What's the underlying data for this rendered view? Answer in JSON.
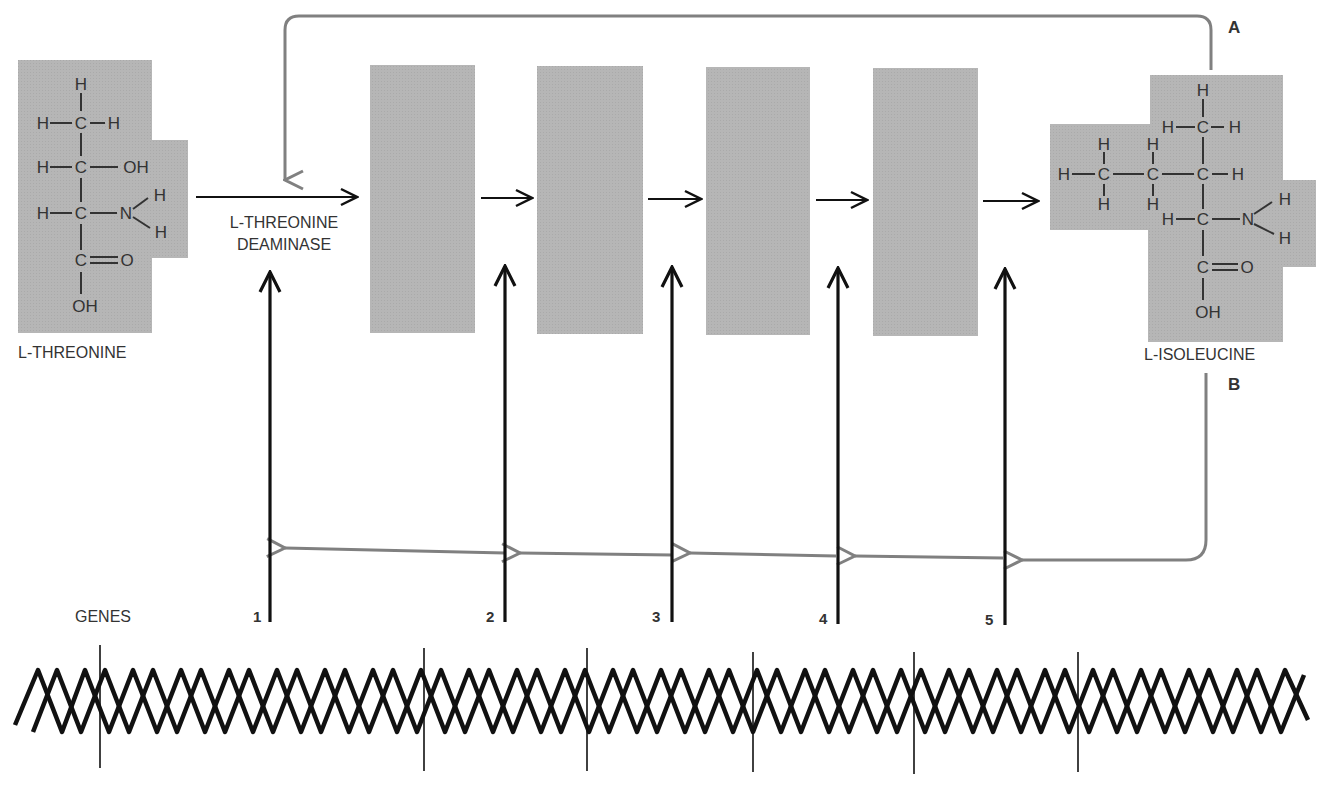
{
  "diagram": {
    "substrate": {
      "name": "L-THREONINE"
    },
    "product": {
      "name": "L-ISOLEUCINE"
    },
    "first_enzyme": {
      "line1": "L-THREONINE",
      "line2": "DEAMINASE"
    },
    "feedback_labels": {
      "a": "A",
      "b": "B"
    },
    "genes_label": "GENES",
    "genes": [
      "1",
      "2",
      "3",
      "4",
      "5"
    ],
    "enzyme_boxes": 4,
    "colors": {
      "panel": "#b4b4b4",
      "arrow": "#111111",
      "feedback": "#808080",
      "text": "#333333"
    },
    "threonine_atoms": {
      "h_top": "H",
      "h_l1": "H",
      "c1": "C",
      "h_r1": "H",
      "h_l2": "H",
      "c2": "C",
      "oh1": "OH",
      "h_l3": "H",
      "c3": "C",
      "n": "N",
      "nh1": "H",
      "nh2": "H",
      "c4": "C",
      "o": "O",
      "oh2": "OH"
    },
    "isoleucine_atoms": {
      "h_top": "H",
      "h_l1": "H",
      "c1": "C",
      "h_r1": "H",
      "h_a": "H",
      "ca": "C",
      "h_b": "H",
      "h_aa": "H",
      "h_ab": "H",
      "h_c": "H",
      "cb": "C",
      "h_cb": "H",
      "c2": "C",
      "h_r2": "H",
      "h_l3": "H",
      "c3": "C",
      "n": "N",
      "nh1": "H",
      "nh2": "H",
      "c4": "C",
      "o": "O",
      "oh": "OH"
    }
  }
}
